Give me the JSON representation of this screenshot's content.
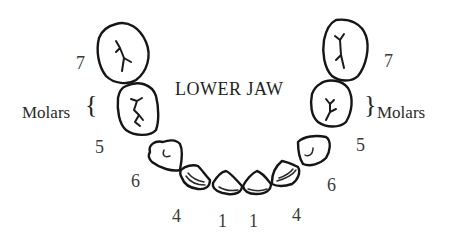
{
  "title": "LOWER JAW",
  "groups": {
    "left": {
      "label": "Molars",
      "brace": "{"
    },
    "right": {
      "label": "Molars",
      "brace": "}"
    }
  },
  "teeth_labels": {
    "left": [
      "7",
      "5",
      "6",
      "4",
      "1"
    ],
    "right": [
      "1",
      "4",
      "6",
      "5",
      "7"
    ]
  },
  "teeth": [
    {
      "side": "left",
      "number": "7",
      "type": "molar"
    },
    {
      "side": "left",
      "number": "5",
      "type": "molar"
    },
    {
      "side": "left",
      "number": "6",
      "type": "premolar"
    },
    {
      "side": "left",
      "number": "4",
      "type": "canine"
    },
    {
      "side": "left",
      "number": "1",
      "type": "incisor"
    },
    {
      "side": "right",
      "number": "1",
      "type": "incisor"
    },
    {
      "side": "right",
      "number": "4",
      "type": "canine"
    },
    {
      "side": "right",
      "number": "6",
      "type": "premolar"
    },
    {
      "side": "right",
      "number": "5",
      "type": "molar"
    },
    {
      "side": "right",
      "number": "7",
      "type": "molar"
    }
  ],
  "colors": {
    "outline": "#151515",
    "text": "#2a2a2a",
    "background": "#ffffff"
  }
}
